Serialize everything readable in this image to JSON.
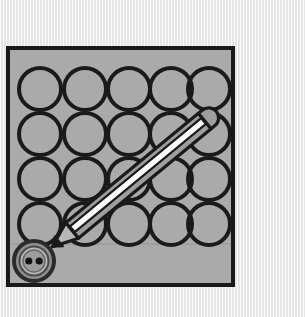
{
  "scene": {
    "title": "Sewing button and pencil illustration",
    "background_color": "#eeeeee",
    "texture": "vertical-stripe-paper"
  },
  "card": {
    "name": "gray-card-panel",
    "x": 6,
    "y": 46,
    "width": 229,
    "height": 241,
    "fill_color": "#aaaaaa",
    "border_color": "#1a1a1a",
    "border_width": 4
  },
  "grid": {
    "label": "circle-grid",
    "columns": 5,
    "rows": 4,
    "circle_radius": 21,
    "circle_stroke_color": "#1a1a1a",
    "circle_stroke_width": 4,
    "circle_fill": "none",
    "x_positions": [
      41,
      86,
      131,
      176,
      203
    ],
    "y_positions": [
      88,
      133,
      178,
      223
    ],
    "centers": [
      [
        41,
        88
      ],
      [
        86,
        88
      ],
      [
        130,
        88
      ],
      [
        172,
        88
      ],
      [
        210,
        88
      ],
      [
        41,
        133
      ],
      [
        86,
        133
      ],
      [
        130,
        133
      ],
      [
        172,
        133
      ],
      [
        210,
        133
      ],
      [
        41,
        178
      ],
      [
        86,
        178
      ],
      [
        130,
        178
      ],
      [
        172,
        178
      ],
      [
        210,
        178
      ],
      [
        41,
        223
      ],
      [
        86,
        223
      ],
      [
        130,
        223
      ],
      [
        172,
        223
      ],
      [
        210,
        223
      ]
    ]
  },
  "button": {
    "name": "sewing-button",
    "center_x": 34,
    "center_y": 261,
    "outer_radius": 20,
    "outer_ring_color": "#3a3a3a",
    "mid_radius": 16,
    "mid_ring_color": "#c0c0c0",
    "inner_radius": 12,
    "inner_fill_color": "#9a9a9a",
    "hole_count": 2,
    "hole_radius": 3.6,
    "hole_color": "#1a1a1a",
    "hole_offset_x": 5.2
  },
  "pencil": {
    "name": "pencil",
    "tip_x": 52,
    "tip_y": 247,
    "tail_x": 206,
    "tail_y": 120,
    "body_color": "#9e9e9e",
    "highlight_color": "#ffffff",
    "outline_color": "#1a1a1a",
    "outline_width": 3,
    "shaft_width": 20,
    "tip_length": 26,
    "angle_degrees": -39,
    "points_at": "sewing-button"
  },
  "shadow_line": {
    "name": "surface-shadow-line",
    "y": 244,
    "color": "#9a9a9a"
  }
}
